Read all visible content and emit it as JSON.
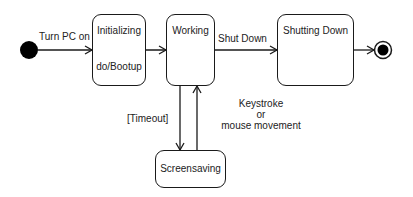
{
  "diagram": {
    "type": "UML state machine",
    "states": [
      {
        "id": "initializing",
        "name": "Initializing",
        "activity": "do/Bootup"
      },
      {
        "id": "working",
        "name": "Working"
      },
      {
        "id": "shutting_down",
        "name": "Shutting Down"
      },
      {
        "id": "screensaving",
        "name": "Screensaving"
      }
    ],
    "transitions": [
      {
        "from": "initial",
        "to": "initializing",
        "label": "Turn PC on"
      },
      {
        "from": "initializing",
        "to": "working",
        "label": ""
      },
      {
        "from": "working",
        "to": "shutting_down",
        "label": "Shut Down"
      },
      {
        "from": "shutting_down",
        "to": "final",
        "label": ""
      },
      {
        "from": "working",
        "to": "screensaving",
        "label": "[Timeout]"
      },
      {
        "from": "screensaving",
        "to": "working",
        "label_line1": "Keystroke",
        "label_line2": "or",
        "label_line3": "mouse movement"
      }
    ],
    "colors": {
      "stroke": "#1a1a1a",
      "fill": "#000000",
      "background": "#ffffff"
    }
  }
}
